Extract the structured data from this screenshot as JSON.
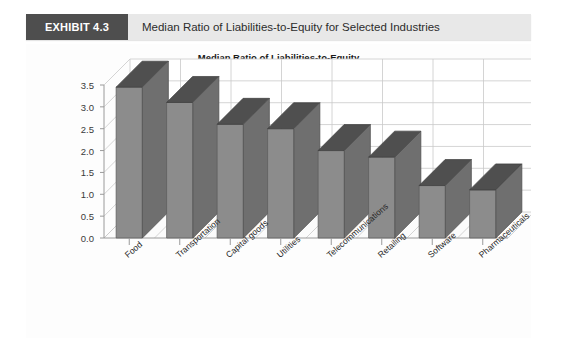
{
  "exhibit": {
    "tag": "EXHIBIT 4.3",
    "caption": "Median Ratio of Liabilities-to-Equity for Selected Industries"
  },
  "chart_data": {
    "type": "bar",
    "title": "Median Ratio of Liabilities-to-Equity",
    "xlabel": "",
    "ylabel": "",
    "categories": [
      "Food",
      "Transportation",
      "Capital goods",
      "Utilities",
      "Telecommunications",
      "Retailing",
      "Software",
      "Pharmaceuticals"
    ],
    "values": [
      3.45,
      3.1,
      2.6,
      2.5,
      2.0,
      1.85,
      1.2,
      1.1
    ],
    "ylim": [
      0.0,
      3.5
    ],
    "yticks": [
      "0.0",
      "0.5",
      "1.0",
      "1.5",
      "2.0",
      "2.5",
      "3.0",
      "3.5"
    ],
    "ytick_values": [
      0.0,
      0.5,
      1.0,
      1.5,
      2.0,
      2.5,
      3.0,
      3.5
    ],
    "grid": true,
    "legend": "none",
    "style": "3d-column",
    "colors": {
      "bar_front": "#8c8c8c",
      "bar_top": "#4f4f4f",
      "bar_side": "#6f6f6f",
      "grid": "#c9c9c9",
      "axis": "#9a9a9a",
      "plot_background": "#ffffff",
      "panel_background": "#fdfdfd",
      "header_background": "#e8e8e8",
      "header_tag_background": "#4e4e4e",
      "header_tag_text": "#ffffff"
    }
  }
}
